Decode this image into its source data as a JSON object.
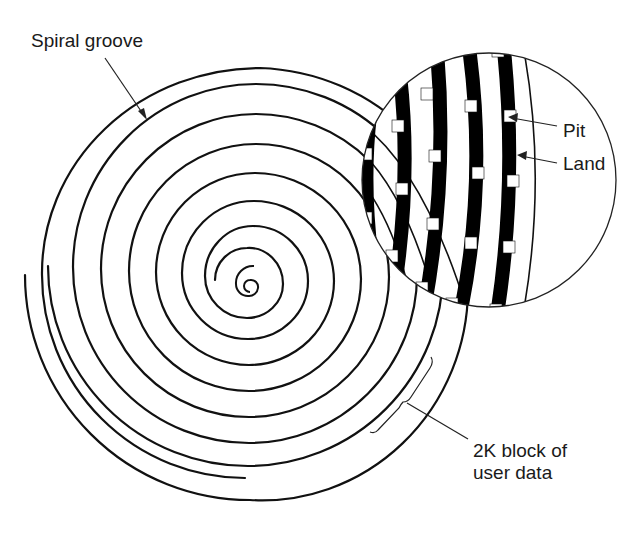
{
  "figure": {
    "type": "cd-rom-spiral-diagram",
    "labels": {
      "spiral_groove": "Spiral groove",
      "pit": "Pit",
      "land": "Land",
      "block_line1": "2K block of",
      "block_line2": "user data"
    },
    "colors": {
      "line": "#111111",
      "background": "#ffffff",
      "track": "#000000",
      "pit": "#ffffff"
    }
  }
}
